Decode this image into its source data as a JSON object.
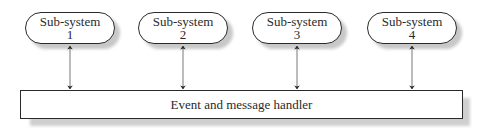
{
  "diagram": {
    "subsystems": [
      {
        "line1": "Sub-system",
        "line2": "1"
      },
      {
        "line1": "Sub-system",
        "line2": "2"
      },
      {
        "line1": "Sub-system",
        "line2": "3"
      },
      {
        "line1": "Sub-system",
        "line2": "4"
      }
    ],
    "handler": {
      "label": "Event and message handler"
    },
    "connections": [
      {
        "from": "Sub-system 1",
        "to": "Event and message handler",
        "type": "bidirectional"
      },
      {
        "from": "Sub-system 2",
        "to": "Event and message handler",
        "type": "bidirectional"
      },
      {
        "from": "Sub-system 3",
        "to": "Event and message handler",
        "type": "bidirectional"
      },
      {
        "from": "Sub-system 4",
        "to": "Event and message handler",
        "type": "bidirectional"
      }
    ]
  }
}
